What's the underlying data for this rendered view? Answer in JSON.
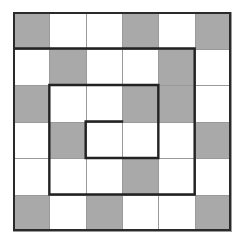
{
  "puzzle": {
    "rows": 6,
    "cols": 6,
    "cell_colors": {
      "shaded": "#a9a9a9",
      "empty": "#ffffff"
    },
    "shaded_cells": [
      [
        0,
        0
      ],
      [
        0,
        3
      ],
      [
        0,
        5
      ],
      [
        1,
        1
      ],
      [
        1,
        4
      ],
      [
        2,
        0
      ],
      [
        2,
        3
      ],
      [
        2,
        4
      ],
      [
        3,
        1
      ],
      [
        3,
        5
      ],
      [
        4,
        3
      ],
      [
        5,
        0
      ],
      [
        5,
        2
      ],
      [
        5,
        5
      ]
    ],
    "spiral_path": [
      [
        0,
        1
      ],
      [
        5,
        1
      ],
      [
        5,
        5
      ],
      [
        1,
        5
      ],
      [
        1,
        2
      ],
      [
        4,
        2
      ],
      [
        4,
        4
      ],
      [
        2,
        4
      ],
      [
        2,
        3
      ],
      [
        3,
        3
      ]
    ],
    "line_color": "#222222"
  }
}
